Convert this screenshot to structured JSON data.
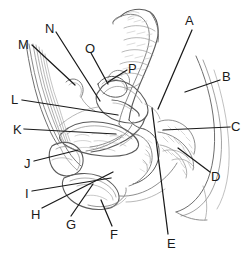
{
  "figure": {
    "style": "pencil line drawing, black ink on white",
    "width_px": 252,
    "height_px": 263,
    "colors": {
      "background": "#ffffff",
      "ink": "#1a1a1a",
      "line_light": "#9a9a9a",
      "line_mid": "#6e6e6e",
      "hatch": "#b5b5b5"
    }
  },
  "labels": [
    {
      "id": "A",
      "text": "A",
      "x": 185,
      "y": 14,
      "line": {
        "x1": 192,
        "y1": 30,
        "x2": 158,
        "y2": 109
      }
    },
    {
      "id": "B",
      "text": "B",
      "x": 222,
      "y": 70,
      "line": {
        "x1": 220,
        "y1": 80,
        "x2": 185,
        "y2": 92
      }
    },
    {
      "id": "C",
      "text": "C",
      "x": 231,
      "y": 120,
      "line": {
        "x1": 230,
        "y1": 127,
        "x2": 163,
        "y2": 130
      }
    },
    {
      "id": "D",
      "text": "D",
      "x": 211,
      "y": 170,
      "line": {
        "x1": 210,
        "y1": 172,
        "x2": 178,
        "y2": 148
      }
    },
    {
      "id": "E",
      "text": "E",
      "x": 167,
      "y": 237,
      "line": {
        "x1": 168,
        "y1": 234,
        "x2": 152,
        "y2": 108
      }
    },
    {
      "id": "F",
      "text": "F",
      "x": 110,
      "y": 228,
      "line": {
        "x1": 112,
        "y1": 226,
        "x2": 101,
        "y2": 200
      }
    },
    {
      "id": "G",
      "text": "G",
      "x": 66,
      "y": 218,
      "line": {
        "x1": 71,
        "y1": 216,
        "x2": 93,
        "y2": 184
      }
    },
    {
      "id": "H",
      "text": "H",
      "x": 31,
      "y": 208,
      "line": {
        "x1": 42,
        "y1": 208,
        "x2": 113,
        "y2": 172
      }
    },
    {
      "id": "I",
      "text": "I",
      "x": 25,
      "y": 187,
      "line": {
        "x1": 32,
        "y1": 191,
        "x2": 111,
        "y2": 178
      }
    },
    {
      "id": "J",
      "text": "J",
      "x": 24,
      "y": 157,
      "line": {
        "x1": 34,
        "y1": 161,
        "x2": 78,
        "y2": 150
      }
    },
    {
      "id": "K",
      "text": "K",
      "x": 13,
      "y": 123,
      "line": {
        "x1": 24,
        "y1": 129,
        "x2": 116,
        "y2": 134
      }
    },
    {
      "id": "L",
      "text": "L",
      "x": 11,
      "y": 93,
      "line": {
        "x1": 22,
        "y1": 100,
        "x2": 118,
        "y2": 115
      }
    },
    {
      "id": "M",
      "text": "M",
      "x": 18,
      "y": 38,
      "line": {
        "x1": 32,
        "y1": 45,
        "x2": 75,
        "y2": 85
      }
    },
    {
      "id": "N",
      "text": "N",
      "x": 45,
      "y": 22,
      "line": {
        "x1": 56,
        "y1": 32,
        "x2": 100,
        "y2": 101
      }
    },
    {
      "id": "O",
      "text": "O",
      "x": 85,
      "y": 42,
      "line": {
        "x1": 91,
        "y1": 53,
        "x2": 108,
        "y2": 84
      }
    },
    {
      "id": "P",
      "text": "P",
      "x": 128,
      "y": 62,
      "line": {
        "x1": 127,
        "y1": 70,
        "x2": 108,
        "y2": 82
      }
    }
  ]
}
